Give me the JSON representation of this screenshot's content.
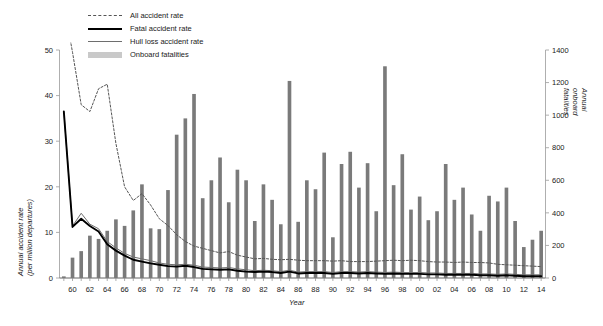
{
  "chart_data": {
    "type": "bar",
    "title": "",
    "xlabel": "Year",
    "ylabel": "Annual accident rate (per million departures)",
    "ylabel_line1": "Annual accident rate",
    "ylabel_line2": "(per million departures)",
    "y2label": "Annual onboard fatalities",
    "ylim": [
      0,
      50
    ],
    "y2lim": [
      0,
      1400
    ],
    "yticks": [
      0,
      10,
      20,
      30,
      40,
      50
    ],
    "y2ticks": [
      0,
      200,
      400,
      600,
      800,
      1000,
      1200,
      1400
    ],
    "grid": false,
    "legend_position": "top-left",
    "x": [
      1959,
      1960,
      1961,
      1962,
      1963,
      1964,
      1965,
      1966,
      1967,
      1968,
      1969,
      1970,
      1971,
      1972,
      1973,
      1974,
      1975,
      1976,
      1977,
      1978,
      1979,
      1980,
      1981,
      1982,
      1983,
      1984,
      1985,
      1986,
      1987,
      1988,
      1989,
      1990,
      1991,
      1992,
      1993,
      1994,
      1995,
      1996,
      1997,
      1998,
      1999,
      2000,
      2001,
      2002,
      2003,
      2004,
      2005,
      2006,
      2007,
      2008,
      2009,
      2010,
      2011,
      2012,
      2013,
      2014
    ],
    "xtick_labels": [
      "60",
      "62",
      "64",
      "66",
      "68",
      "70",
      "72",
      "74",
      "76",
      "78",
      "80",
      "82",
      "84",
      "86",
      "88",
      "90",
      "92",
      "94",
      "96",
      "98",
      "00",
      "02",
      "04",
      "06",
      "08",
      "10",
      "12",
      "14"
    ],
    "xtick_years": [
      1960,
      1962,
      1964,
      1966,
      1968,
      1970,
      1972,
      1974,
      1976,
      1978,
      1980,
      1982,
      1984,
      1986,
      1988,
      1990,
      1992,
      1994,
      1996,
      1998,
      2000,
      2002,
      2004,
      2006,
      2008,
      2010,
      2012,
      2014
    ],
    "series": [
      {
        "name": "All accident rate",
        "axis": "left",
        "style": "dashed",
        "color": "#555555",
        "values": [
          60.0,
          49.5,
          38.0,
          36.5,
          41.5,
          42.5,
          29.5,
          20.0,
          17.0,
          18.5,
          16.0,
          13.0,
          11.5,
          9.5,
          8.0,
          7.0,
          6.5,
          6.0,
          5.5,
          5.8,
          5.0,
          4.6,
          4.2,
          4.3,
          4.1,
          4.0,
          4.1,
          3.9,
          3.8,
          3.8,
          3.8,
          3.7,
          3.8,
          3.6,
          3.6,
          3.6,
          3.7,
          3.8,
          3.9,
          3.8,
          3.9,
          3.8,
          3.6,
          3.5,
          3.5,
          3.4,
          3.5,
          3.4,
          3.4,
          3.3,
          3.0,
          2.9,
          2.8,
          2.7,
          2.6,
          2.5
        ]
      },
      {
        "name": "Fatal accident rate",
        "axis": "left",
        "style": "solid-thick",
        "color": "#000000",
        "values": [
          36.5,
          11.2,
          13.0,
          11.4,
          10.2,
          7.4,
          6.0,
          4.9,
          4.0,
          3.6,
          3.2,
          2.9,
          2.6,
          2.5,
          2.7,
          2.4,
          2.0,
          1.9,
          1.8,
          1.9,
          1.6,
          1.4,
          1.3,
          1.4,
          1.3,
          1.1,
          1.4,
          1.0,
          1.1,
          1.1,
          1.1,
          0.9,
          1.1,
          1.1,
          1.0,
          1.1,
          1.0,
          0.9,
          1.0,
          0.9,
          0.9,
          0.9,
          0.8,
          0.8,
          0.7,
          0.7,
          0.7,
          0.7,
          0.6,
          0.6,
          0.5,
          0.6,
          0.5,
          0.4,
          0.4,
          0.4
        ]
      },
      {
        "name": "Hull loss accident rate",
        "axis": "left",
        "style": "solid-thin",
        "color": "#6e6e6e",
        "values": [
          36.5,
          11.4,
          14.2,
          11.8,
          10.8,
          8.0,
          6.6,
          5.4,
          4.6,
          4.2,
          3.8,
          3.3,
          3.0,
          2.9,
          3.0,
          2.8,
          2.4,
          2.3,
          2.2,
          2.3,
          2.0,
          1.8,
          1.6,
          1.7,
          1.6,
          1.4,
          1.7,
          1.3,
          1.4,
          1.4,
          1.4,
          1.2,
          1.4,
          1.4,
          1.3,
          1.4,
          1.3,
          1.2,
          1.3,
          1.2,
          1.2,
          1.2,
          1.1,
          1.1,
          1.0,
          1.0,
          1.0,
          1.0,
          0.9,
          0.9,
          0.8,
          0.9,
          0.8,
          0.7,
          0.7,
          0.7
        ]
      }
    ],
    "bars": {
      "name": "Onboard fatalities",
      "axis": "right",
      "color": "#7a7a7a",
      "values": [
        10,
        125,
        165,
        260,
        240,
        290,
        360,
        320,
        415,
        575,
        305,
        300,
        540,
        880,
        980,
        1130,
        490,
        600,
        740,
        465,
        665,
        600,
        350,
        575,
        480,
        330,
        1210,
        345,
        600,
        545,
        770,
        250,
        700,
        775,
        555,
        705,
        410,
        1300,
        570,
        760,
        420,
        500,
        355,
        410,
        700,
        480,
        555,
        390,
        290,
        505,
        470,
        555,
        350,
        190,
        235,
        290
      ]
    }
  },
  "legend": {
    "items": [
      {
        "label": "All accident rate",
        "key": "dashed-line-key"
      },
      {
        "label": "Fatal accident rate",
        "key": "thick-black-line-key"
      },
      {
        "label": "Hull loss accident rate",
        "key": "gray-line-key"
      },
      {
        "label": "Onboard fatalities",
        "key": "gray-bar-key"
      }
    ]
  }
}
